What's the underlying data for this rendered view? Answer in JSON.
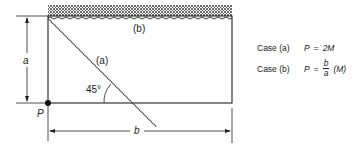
{
  "diagram": {
    "labels": {
      "case_b_region": "(b)",
      "case_a_line": "(a)",
      "angle": "45°",
      "dim_a": "a",
      "dim_b": "b",
      "point_p": "P"
    },
    "equations": [
      {
        "case": "Case (a)",
        "lhs": "P",
        "eq": "=",
        "rhs": "2M"
      },
      {
        "case": "Case (b)",
        "lhs": "P",
        "eq": "=",
        "frac_num": "b",
        "frac_den": "a",
        "rhs": "(M)"
      }
    ],
    "colors": {
      "line": "#222222",
      "hatch": "#555555"
    }
  }
}
